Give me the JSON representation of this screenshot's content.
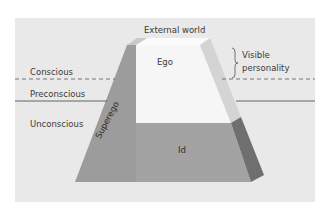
{
  "diagram": {
    "levels": {
      "conscious": "Conscious",
      "preconscious": "Preconscious",
      "unconscious": "Unconscious"
    },
    "components": {
      "ego": "Ego",
      "superego": "Superego",
      "id": "Id"
    },
    "annotations": {
      "external_world": "External world",
      "visible_line1": "Visible",
      "visible_line2": "personality"
    },
    "colors": {
      "background_panel": "#e9e9e9",
      "ego_face": "#f6f6f6",
      "ego_top": "#fbfbfb",
      "ego_right_face": "#d4d4d4",
      "superego_face": "#9c9c9c",
      "id_face": "#a3a3a3",
      "id_right_face": "#6f6f6f",
      "line": "#555555",
      "text": "#3a3a3a"
    }
  }
}
